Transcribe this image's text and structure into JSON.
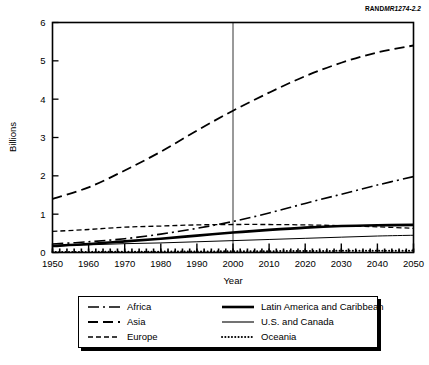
{
  "figure": {
    "source_label_bold": "RAND",
    "source_label_italic": "MR1274-2.2"
  },
  "chart_data": {
    "type": "line",
    "title": "",
    "xlabel": "Year",
    "ylabel": "Billions",
    "xlim": [
      1950,
      2050
    ],
    "ylim": [
      0,
      6
    ],
    "xticks": [
      1950,
      1960,
      1970,
      1980,
      1990,
      2000,
      2010,
      2020,
      2030,
      2040,
      2050
    ],
    "yticks": [
      0,
      1,
      2,
      3,
      4,
      5,
      6
    ],
    "grid": false,
    "legend_position": "below-plot",
    "annotations": [
      {
        "type": "vertical-line",
        "x": 2000,
        "label": "year-2000-reference-line"
      }
    ],
    "x": [
      1950,
      1960,
      1970,
      1980,
      1990,
      2000,
      2010,
      2020,
      2030,
      2040,
      2050
    ],
    "series": [
      {
        "name": "Africa",
        "style": "dash-dot",
        "width": 1.6,
        "values": [
          0.22,
          0.28,
          0.36,
          0.48,
          0.63,
          0.81,
          1.03,
          1.28,
          1.52,
          1.76,
          1.98
        ]
      },
      {
        "name": "Asia",
        "style": "long-dash",
        "width": 1.8,
        "values": [
          1.4,
          1.7,
          2.14,
          2.63,
          3.18,
          3.7,
          4.17,
          4.6,
          4.95,
          5.22,
          5.4
        ]
      },
      {
        "name": "Europe",
        "style": "short-dash",
        "width": 1.3,
        "values": [
          0.55,
          0.6,
          0.66,
          0.69,
          0.72,
          0.73,
          0.73,
          0.72,
          0.7,
          0.67,
          0.63
        ]
      },
      {
        "name": "Latin America and Caribbean",
        "style": "thick-solid",
        "width": 2.6,
        "values": [
          0.17,
          0.22,
          0.29,
          0.36,
          0.44,
          0.52,
          0.59,
          0.65,
          0.69,
          0.71,
          0.72
        ]
      },
      {
        "name": "U.S. and Canada",
        "style": "thin-solid",
        "width": 1.0,
        "values": [
          0.17,
          0.2,
          0.23,
          0.25,
          0.28,
          0.31,
          0.34,
          0.37,
          0.4,
          0.43,
          0.45
        ]
      },
      {
        "name": "Oceania",
        "style": "dotted",
        "width": 2.0,
        "values": [
          0.013,
          0.016,
          0.02,
          0.023,
          0.027,
          0.031,
          0.035,
          0.039,
          0.043,
          0.046,
          0.049
        ]
      }
    ]
  },
  "legend": {
    "entries": [
      {
        "label": "Africa",
        "style": "dash-dot"
      },
      {
        "label": "Latin America and Caribbean",
        "style": "thick-solid"
      },
      {
        "label": "Asia",
        "style": "long-dash"
      },
      {
        "label": "U.S. and Canada",
        "style": "thin-solid"
      },
      {
        "label": "Europe",
        "style": "short-dash"
      },
      {
        "label": "Oceania",
        "style": "dotted"
      }
    ]
  }
}
